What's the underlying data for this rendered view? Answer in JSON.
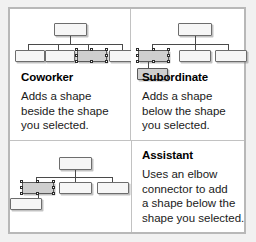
{
  "theme": {
    "page_background": "#f1f1f1",
    "card_background": "#ffffff",
    "card_border": "#b8b8b8",
    "divider": "#c2c2c2",
    "node_fill": "#f6f6f6",
    "node_border": "#6d6d6d",
    "node_selected_fill": "#cfcfcf",
    "connector": "#4a4a4a",
    "heading_color": "#000000",
    "body_color": "#1a1a1a"
  },
  "panels": [
    {
      "id": "coworker",
      "heading": "Coworker",
      "description_lines": [
        "Adds a shape",
        "beside the shape",
        "you selected."
      ],
      "diagram": {
        "type": "org-chart",
        "connector_style": "straight",
        "nodes": [
          {
            "label": "",
            "selected": false,
            "role": "root"
          },
          {
            "label": "",
            "selected": false,
            "role": "child"
          },
          {
            "label": "",
            "selected": false,
            "role": "child"
          },
          {
            "label": "",
            "selected": true,
            "role": "child-selected"
          },
          {
            "label": "",
            "selected": false,
            "role": "child-new"
          }
        ],
        "selected_node_index": 3
      }
    },
    {
      "id": "subordinate",
      "heading": "Subordinate",
      "description_lines": [
        "Adds a shape",
        "below the shape",
        "you selected."
      ],
      "diagram": {
        "type": "org-chart",
        "connector_style": "straight",
        "nodes": [
          {
            "label": "",
            "selected": false,
            "role": "root"
          },
          {
            "label": "",
            "selected": true,
            "role": "child-selected"
          },
          {
            "label": "",
            "selected": false,
            "role": "child"
          },
          {
            "label": "",
            "selected": false,
            "role": "child"
          },
          {
            "label": "",
            "selected": true,
            "role": "subordinate-new"
          }
        ],
        "selected_node_index": 1
      }
    },
    {
      "id": "assistant",
      "heading": "Assistant",
      "description_lines": [
        "Uses an elbow",
        "connector to add",
        "a shape below the",
        "shape you selected."
      ],
      "diagram": {
        "type": "org-chart",
        "connector_style": "elbow",
        "nodes": [
          {
            "label": "",
            "selected": false,
            "role": "root"
          },
          {
            "label": "",
            "selected": true,
            "role": "child-selected"
          },
          {
            "label": "",
            "selected": false,
            "role": "child"
          },
          {
            "label": "",
            "selected": false,
            "role": "child"
          },
          {
            "label": "",
            "selected": false,
            "role": "assistant-new"
          }
        ],
        "selected_node_index": 1
      }
    }
  ]
}
